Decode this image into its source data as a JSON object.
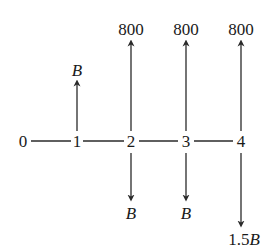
{
  "diagram": {
    "type": "cash-flow-diagram",
    "periods": [
      "0",
      "1",
      "2",
      "3",
      "4"
    ],
    "inflows": [
      {
        "period": "1",
        "label": "B"
      },
      {
        "period": "2",
        "label": "800"
      },
      {
        "period": "3",
        "label": "800"
      },
      {
        "period": "4",
        "label": "800"
      }
    ],
    "outflows": [
      {
        "period": "2",
        "label": "B"
      },
      {
        "period": "3",
        "label": "B"
      },
      {
        "period": "4",
        "label": "1.5B",
        "label_num": "1.5",
        "label_var": "B"
      }
    ],
    "colors": {
      "line": "#2a2a2a",
      "text": "#1a1a1a",
      "background": "#ffffff"
    }
  }
}
